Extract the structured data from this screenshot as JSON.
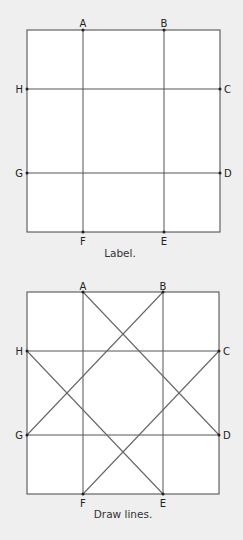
{
  "diagrams": [
    {
      "caption": "Label.",
      "points": {
        "A": "A",
        "B": "B",
        "C": "C",
        "D": "D",
        "E": "E",
        "F": "F",
        "G": "G",
        "H": "H"
      },
      "lines": [
        "A-F",
        "B-E",
        "H-C",
        "G-D"
      ]
    },
    {
      "caption": "Draw lines.",
      "points": {
        "A": "A",
        "B": "B",
        "C": "C",
        "D": "D",
        "E": "E",
        "F": "F",
        "G": "G",
        "H": "H"
      },
      "lines": [
        "A-F",
        "B-E",
        "H-C",
        "G-D",
        "A-D",
        "B-G",
        "H-E",
        "C-F"
      ]
    }
  ],
  "colors": {
    "background": "#efefef",
    "square": "#ffffff",
    "stroke": "#555555"
  }
}
